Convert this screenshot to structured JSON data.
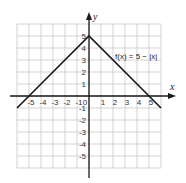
{
  "chart_data": {
    "type": "line",
    "title": "",
    "xlabel": "x",
    "ylabel": "y",
    "xlim": [
      -6,
      6
    ],
    "ylim": [
      -6,
      6
    ],
    "grid": true,
    "x_ticks": [
      -5,
      -4,
      -3,
      -2,
      -1,
      0,
      1,
      2,
      3,
      4,
      5
    ],
    "y_ticks": [
      5,
      4,
      3,
      2,
      1,
      -1,
      -2,
      -3,
      -4,
      -5
    ],
    "annotations": [
      {
        "text": "f(x) = 5 − |x|",
        "x": 2.2,
        "y": 3.3
      }
    ],
    "series": [
      {
        "name": "f(x) = 5 − |x|",
        "x": [
          -6,
          -5,
          0,
          5,
          6
        ],
        "y": [
          -1,
          0,
          5,
          0,
          -1
        ]
      }
    ]
  },
  "labels": {
    "x_axis": "x",
    "y_axis": "y",
    "function": "f(x) = 5 − |x|"
  },
  "colors": {
    "grid": "#c8c8c8",
    "axis": "#1a1a1a",
    "line": "#1a1a1a"
  }
}
